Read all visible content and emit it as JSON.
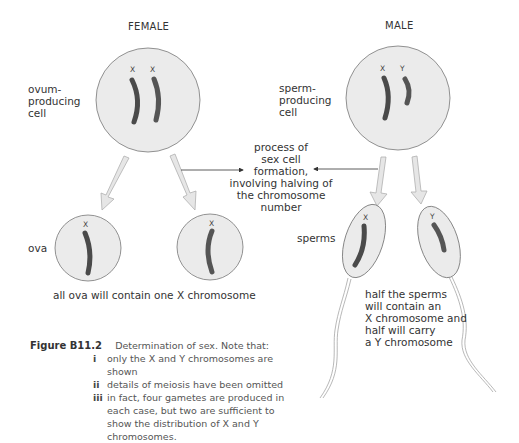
{
  "headings": {
    "female": "FEMALE",
    "male": "MALE"
  },
  "labels": {
    "ovum_producing_cell": [
      "ovum-",
      "producing",
      "cell"
    ],
    "sperm_producing_cell": [
      "sperm-",
      "producing",
      "cell"
    ],
    "ova": "ova",
    "sperms": "sperms",
    "process": [
      "process of",
      "sex cell",
      "formation,",
      "involving halving of",
      "the chromosome",
      "number"
    ],
    "ova_note": "all ova will contain one X chromosome",
    "sperm_note": [
      "half the sperms",
      "will contain an",
      "X chromosome and",
      "half will carry",
      "a Y chromosome"
    ]
  },
  "chromosomes": {
    "female_cell": [
      "X",
      "X"
    ],
    "male_cell": [
      "X",
      "Y"
    ],
    "ovum_1": "X",
    "ovum_2": "X",
    "sperm_1": "X",
    "sperm_2": "Y"
  },
  "caption": {
    "figure_label": "Figure B11.2",
    "text": "Determination of sex. Note that:",
    "notes": [
      {
        "num": "i",
        "text": "only the X and Y chromosomes are shown"
      },
      {
        "num": "ii",
        "text": "details of meiosis have been omitted"
      },
      {
        "num": "iii",
        "text": "in fact, four gametes are produced in each case, but two are sufficient to show the distribution of X and Y chromosomes."
      }
    ]
  },
  "colors": {
    "cell_fill": "#ebebeb",
    "cell_stroke": "#777777",
    "chromosome": "#4a4a4a",
    "arrow_fill": "#e6e6e6",
    "arrow_stroke": "#b0b0b0"
  }
}
